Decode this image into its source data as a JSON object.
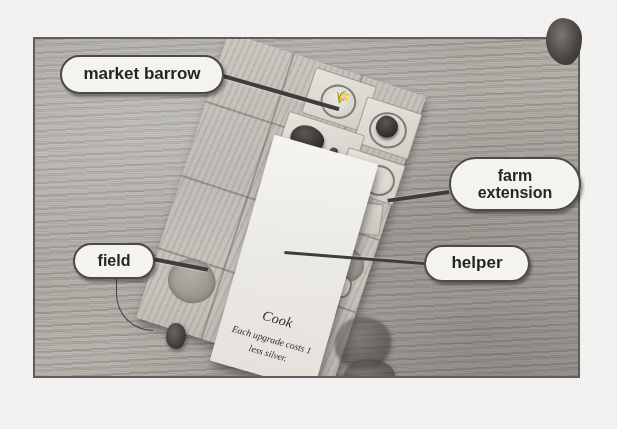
{
  "figure": {
    "kind": "annotated-photograph"
  },
  "callouts": [
    {
      "id": "market-barrow",
      "label": "market barrow",
      "points_to": "dark barrow token on the board tile strip"
    },
    {
      "id": "farm-extension",
      "label": "farm\nextension",
      "points_to": "extension piece at right edge of board"
    },
    {
      "id": "field",
      "label": "field",
      "points_to": "round ploughed field space left of the card"
    },
    {
      "id": "helper",
      "label": "helper",
      "points_to": "helper meeple beside the card"
    }
  ],
  "card": {
    "title": "Cook",
    "text": "Each upgrade\ncosts 1 less silver."
  },
  "colors": {
    "callout_fill": "#f4f3f0",
    "callout_border": "#4c4a47",
    "leader_line": "#3f3d3a",
    "photo_border": "#5e5d5b",
    "page_background": "#f4f3f1",
    "table_surface": "#b0ada7",
    "board": "#c2bfb9",
    "card": "#f1efea"
  }
}
